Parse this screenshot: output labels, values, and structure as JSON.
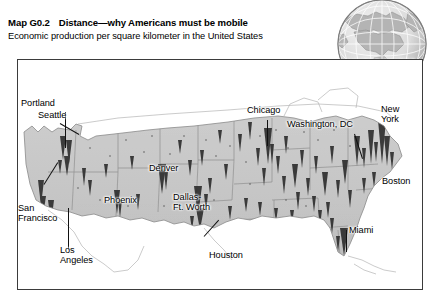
{
  "header": {
    "map_tag": "Map G0.2",
    "title": "Distance—why Americans must be mobile",
    "subtitle": "Economic production per square kilometer in the United States"
  },
  "inset": {
    "label": "UNITED STATES",
    "icon": "globe-icon"
  },
  "map": {
    "region": "contiguous United States",
    "surface_type": "3D spike / prism density surface",
    "labels": [
      {
        "id": "portland",
        "text": "Portland",
        "x": 3,
        "y": 41,
        "align": "left"
      },
      {
        "id": "seattle",
        "text": "Seattle",
        "x": 20,
        "y": 52,
        "align": "left"
      },
      {
        "id": "san-francisco",
        "text": "San Francisco",
        "x": 0,
        "y": 150,
        "align": "left",
        "lines": [
          "San",
          "Francisco"
        ]
      },
      {
        "id": "los-angeles",
        "text": "Los Angeles",
        "x": 42,
        "y": 190,
        "align": "left",
        "lines": [
          "Los",
          "Angeles"
        ]
      },
      {
        "id": "phoenix",
        "text": "Phoenix",
        "x": 86,
        "y": 139,
        "align": "left"
      },
      {
        "id": "denver",
        "text": "Denver",
        "x": 129,
        "y": 108,
        "align": "left"
      },
      {
        "id": "dallas-ft-worth",
        "text": "Dallas-Ft. Worth",
        "x": 155,
        "y": 137,
        "align": "left",
        "lines": [
          "Dallas-",
          "Ft. Worth"
        ]
      },
      {
        "id": "houston",
        "text": "Houston",
        "x": 190,
        "y": 197,
        "align": "left"
      },
      {
        "id": "chicago",
        "text": "Chicago",
        "x": 233,
        "y": 48,
        "align": "left"
      },
      {
        "id": "washington-dc",
        "text": "Washington, DC",
        "x": 270,
        "y": 62,
        "align": "left"
      },
      {
        "id": "new-york",
        "text": "New York",
        "x": 362,
        "y": 48,
        "align": "left",
        "lines": [
          "New",
          "York"
        ]
      },
      {
        "id": "boston",
        "text": "Boston",
        "x": 365,
        "y": 119,
        "align": "left"
      },
      {
        "id": "miami",
        "text": "Miami",
        "x": 331,
        "y": 178,
        "align": "left"
      }
    ]
  },
  "colors": {
    "frame_border": "#3b3b3b",
    "land_fill": "#c9c9c9",
    "spike_dark": "#2b2b2b",
    "water_fill": "#ffffff",
    "text": "#000000"
  }
}
